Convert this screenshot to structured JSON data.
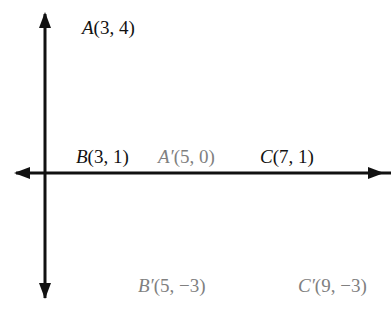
{
  "diagram": {
    "type": "coordinate-plane-translation",
    "grid": {
      "x_range": [
        -1,
        11
      ],
      "y_range": [
        -4,
        5
      ],
      "cell_color": "#bdbdbd",
      "border_color": "#bdbdbd"
    },
    "axes": {
      "x_label": "x",
      "y_label": "y",
      "origin_label": "O",
      "x_ticks": [
        {
          "value": 3,
          "label": "3"
        },
        {
          "value": 6,
          "label": "6"
        },
        {
          "value": 9,
          "label": "9"
        }
      ],
      "y_ticks": [
        {
          "value": 3,
          "label": "3"
        },
        {
          "value": -3,
          "label": "−3"
        }
      ]
    },
    "original_triangle": {
      "color": "#111111",
      "vertices": [
        {
          "name": "A",
          "x": 3,
          "y": 4,
          "label": "A(3, 4)"
        },
        {
          "name": "B",
          "x": 3,
          "y": 1,
          "label": "B(3, 1)"
        },
        {
          "name": "C",
          "x": 7,
          "y": 1,
          "label": "C(7, 1)"
        }
      ]
    },
    "image_triangle": {
      "color": "#6e6e6e",
      "vertices": [
        {
          "name": "A'",
          "x": 5,
          "y": 0,
          "label": "A′(5, 0)"
        },
        {
          "name": "B'",
          "x": 5,
          "y": -3,
          "label": "B′(5, −3)"
        },
        {
          "name": "C'",
          "x": 9,
          "y": -3,
          "label": "C′(9, −3)"
        }
      ]
    }
  }
}
